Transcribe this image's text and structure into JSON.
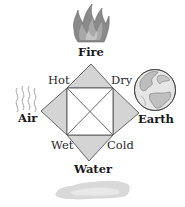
{
  "diagram": {
    "elements": {
      "top": "Fire",
      "left": "Air",
      "right": "Earth",
      "bottom": "Water"
    },
    "qualities": {
      "top_left": "Hot",
      "top_right": "Dry",
      "bottom_left": "Wet",
      "bottom_right": "Cold"
    },
    "icons": {
      "fire": "flame-icon",
      "air": "air-waves-icon",
      "earth": "globe-icon",
      "water": "puddle-icon"
    },
    "colors": {
      "triangle_fill": "#d4d4d4",
      "stroke": "#555555",
      "flame": "#7a7a7a",
      "puddle": "#d8d8d8",
      "text": "#1a1a1a"
    }
  }
}
